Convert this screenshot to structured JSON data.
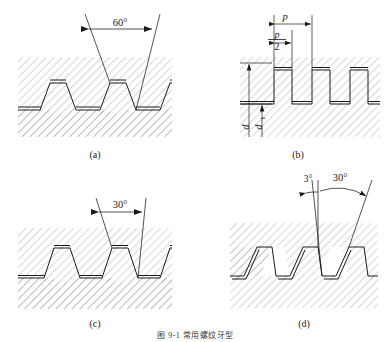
{
  "figure": {
    "caption": "图 9-1  常用螺纹牙型",
    "background": "#ffffff",
    "line_color": "#1a1a1a",
    "hatch_color": "#9a9a9a"
  },
  "panels": [
    {
      "id": "a",
      "label": "(a)",
      "name": "triangular-thread-profile",
      "thread_type": "triangular",
      "annotations": [
        {
          "name": "flank-angle",
          "text": "60°",
          "value": 60,
          "unit": "degree"
        }
      ]
    },
    {
      "id": "b",
      "label": "(b)",
      "name": "square-thread-profile",
      "thread_type": "square",
      "annotations": [
        {
          "name": "pitch",
          "text": "p",
          "value": "p",
          "unit": "pitch"
        },
        {
          "name": "half-pitch-numerator",
          "text": "p",
          "value": "p",
          "unit": "pitch"
        },
        {
          "name": "half-pitch-denominator",
          "text": "2",
          "value": "2",
          "unit": ""
        },
        {
          "name": "major-diameter",
          "text": "d",
          "value": "d",
          "unit": "diameter"
        },
        {
          "name": "minor-diameter",
          "text": "d",
          "subscript": "1",
          "value": "d1",
          "unit": "diameter"
        }
      ]
    },
    {
      "id": "c",
      "label": "(c)",
      "name": "trapezoidal-thread-profile",
      "thread_type": "trapezoidal",
      "annotations": [
        {
          "name": "flank-angle",
          "text": "30°",
          "value": 30,
          "unit": "degree"
        }
      ]
    },
    {
      "id": "d",
      "label": "(d)",
      "name": "buttress-thread-profile",
      "thread_type": "buttress",
      "annotations": [
        {
          "name": "pressure-flank-angle",
          "text": "3°",
          "value": 3,
          "unit": "degree"
        },
        {
          "name": "trailing-flank-angle",
          "text": "30°",
          "value": 30,
          "unit": "degree"
        }
      ]
    }
  ]
}
